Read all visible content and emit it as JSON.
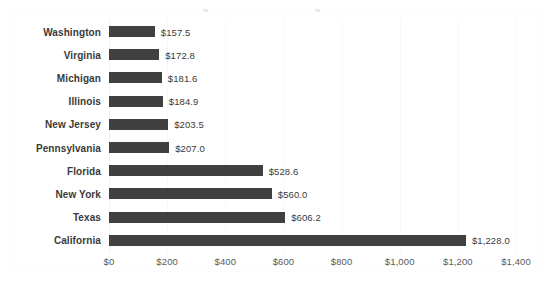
{
  "chart_data": {
    "type": "bar",
    "orientation": "horizontal",
    "title": "",
    "xlabel": "",
    "ylabel": "",
    "categories": [
      "Washington",
      "Virginia",
      "Michigan",
      "Illinois",
      "New Jersey",
      "Pennsylvania",
      "Florida",
      "New York",
      "Texas",
      "California"
    ],
    "values": [
      157.5,
      172.8,
      181.6,
      184.9,
      203.5,
      207.0,
      528.6,
      560.0,
      606.2,
      1228.0
    ],
    "data_labels": [
      "$157.5",
      "$172.8",
      "$181.6",
      "$184.9",
      "$203.5",
      "$207.0",
      "$528.6",
      "$560.0",
      "$606.2",
      "$1,228.0"
    ],
    "xlim": [
      0,
      1400
    ],
    "xticks": [
      0,
      200,
      400,
      600,
      800,
      1000,
      1200,
      1400
    ],
    "xtick_labels": [
      "$0",
      "$200",
      "$400",
      "$600",
      "$800",
      "$1,000",
      "$1,200",
      "$1,400"
    ],
    "grid": true,
    "grid_axis": "x",
    "legend": false,
    "bar_color": "#404040",
    "gridline_color": "#f7f7f7",
    "label_color": "#3a3a3a",
    "tick_color": "#5a5a5a",
    "background_color": "#ffffff"
  }
}
